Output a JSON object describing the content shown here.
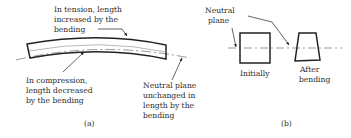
{
  "figure_a": {
    "caption": "(a)",
    "tension_label": [
      "In tension, length",
      "increased by the",
      "bending"
    ],
    "compression_label": [
      "In compression,",
      "length decreased",
      "by the bending"
    ],
    "neutral_label": [
      "Neutral plane",
      "unchanged in",
      "length by the",
      "bending"
    ]
  },
  "figure_b": {
    "caption": "(b)",
    "neutral_label": [
      "Neutral",
      "plane"
    ],
    "initial_label": "Initially",
    "after_label": [
      "After",
      "bending"
    ]
  }
}
